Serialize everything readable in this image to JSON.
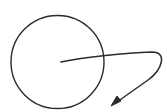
{
  "diagram": {
    "background": "#ffffff",
    "stroke_color": "#2b2b2b",
    "circle": {
      "cx": 57.5,
      "cy": 62,
      "r": 46.5,
      "stroke_width": 1.4
    },
    "arrow": {
      "path": "M61 62 C 85 57, 125 53, 152 52 C 168 52, 162 70, 148 80 C 137 88, 125 96, 116 103",
      "stroke_width": 1.5,
      "head_points": "111,106 117,96 121,101"
    }
  }
}
